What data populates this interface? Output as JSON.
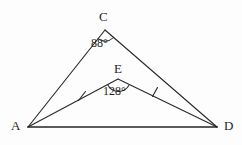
{
  "figure": {
    "background_color": "#fdfdfd",
    "line_color": "#2b2b2b",
    "text_color": "#1f1f1f"
  },
  "vertices": {
    "A": {
      "label": "A",
      "x": 28,
      "y": 127
    },
    "C": {
      "label": "C",
      "x": 105,
      "y": 30
    },
    "D": {
      "label": "D",
      "x": 217,
      "y": 127
    },
    "E": {
      "label": "E",
      "x": 118,
      "y": 79
    }
  },
  "angles": {
    "at_C": {
      "value": "88°",
      "vertex": "C",
      "degrees": 88
    },
    "at_E": {
      "value": "128°",
      "vertex": "E",
      "degrees": 128
    }
  },
  "segments": [
    {
      "name": "AC",
      "from": "A",
      "to": "C",
      "ticks": 0
    },
    {
      "name": "CD",
      "from": "C",
      "to": "D",
      "ticks": 0
    },
    {
      "name": "AE",
      "from": "A",
      "to": "E",
      "ticks": 1
    },
    {
      "name": "ED",
      "from": "E",
      "to": "D",
      "ticks": 1
    },
    {
      "name": "AD",
      "from": "A",
      "to": "D",
      "ticks": 0
    }
  ],
  "tick_marks": [
    {
      "segment": "AE",
      "x": 82,
      "y": 96
    },
    {
      "segment": "ED",
      "x": 155,
      "y": 92
    }
  ]
}
